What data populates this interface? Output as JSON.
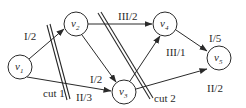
{
  "diagram": {
    "type": "flow-network-with-cuts",
    "nodes": [
      {
        "id": "v1",
        "base": "v",
        "sub": "1",
        "x": 20,
        "y": 67
      },
      {
        "id": "v2",
        "base": "v",
        "sub": "2",
        "x": 76,
        "y": 24
      },
      {
        "id": "v3",
        "base": "v",
        "sub": "3",
        "x": 124,
        "y": 92
      },
      {
        "id": "v4",
        "base": "v",
        "sub": "4",
        "x": 165,
        "y": 24
      },
      {
        "id": "v5",
        "base": "v",
        "sub": "5",
        "x": 219,
        "y": 58
      }
    ],
    "edges": [
      {
        "from": "v1",
        "to": "v2",
        "label": "I/2"
      },
      {
        "from": "v1",
        "to": "v3",
        "label": "II/3"
      },
      {
        "from": "v2",
        "to": "v3",
        "label": "I/2"
      },
      {
        "from": "v2",
        "to": "v4",
        "label": "III/2"
      },
      {
        "from": "v3",
        "to": "v4",
        "label": "III/1"
      },
      {
        "from": "v4",
        "to": "v5",
        "label": "I/5"
      },
      {
        "from": "v3",
        "to": "v5",
        "label": "II/2"
      }
    ],
    "cuts": [
      {
        "label": "cut 1"
      },
      {
        "label": "cut 2"
      }
    ]
  }
}
